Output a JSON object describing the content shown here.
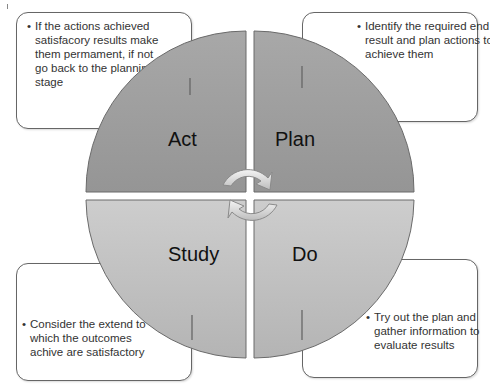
{
  "diagram": {
    "type": "PDSA cycle",
    "quadrants": [
      {
        "id": "act",
        "label": "Act",
        "position": "top-left",
        "color": "#9c9c9c"
      },
      {
        "id": "plan",
        "label": "Plan",
        "position": "top-right",
        "color": "#9c9c9c"
      },
      {
        "id": "study",
        "label": "Study",
        "position": "bottom-left",
        "color": "#c2c2c2"
      },
      {
        "id": "do",
        "label": "Do",
        "position": "bottom-right",
        "color": "#c2c2c2"
      }
    ],
    "notes": {
      "act": "If the actions achieved satisfacory results make them permament, if not go back to the planning stage",
      "plan": "Identify the required end result and plan actions to achieve them",
      "study": "Consider the extend to which the outcomes achive are satisfactory",
      "do": "Try out the plan and gather information to evaluate results"
    },
    "note_lines": {
      "act": [
        "If the actions achieved",
        "satisfacory results make",
        "them permament, if not",
        "go back to the planning",
        "stage"
      ],
      "plan": [
        "Identify the required end",
        "result and plan actions to",
        "achieve them"
      ],
      "study": [
        "Consider the extend to",
        "which the outcomes",
        "achive are satisfactory"
      ],
      "do": [
        "Try out the plan and",
        "gather information to",
        "evaluate results"
      ]
    },
    "bullet": "•",
    "center_icon": "cycle-arrows-icon"
  }
}
